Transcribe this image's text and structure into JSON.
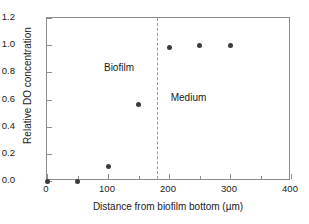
{
  "chart_data": {
    "type": "scatter",
    "title": "",
    "xlabel": "Distance from biofilm bottom (µm)",
    "ylabel": "Relative DO concentration",
    "xlim": [
      0,
      400
    ],
    "ylim": [
      0.0,
      1.2
    ],
    "grid": false,
    "legend": null,
    "xticks": [
      "0",
      "100",
      "200",
      "300",
      "400"
    ],
    "xtick_values": [
      0,
      100,
      200,
      300,
      400
    ],
    "xminor_values": [
      50,
      150,
      250,
      350
    ],
    "yticks": [
      "0.0",
      "0.2",
      "0.4",
      "0.6",
      "0.8",
      "1.0",
      "1.2"
    ],
    "ytick_values": [
      0.0,
      0.2,
      0.4,
      0.6,
      0.8,
      1.0,
      1.2
    ],
    "series": [
      {
        "name": "Relative DO concentration",
        "marker": "filled-circle",
        "color": "#3b3b3b",
        "x": [
          0,
          50,
          100,
          150,
          200,
          250,
          300
        ],
        "y": [
          0.0,
          0.0,
          0.11,
          0.56,
          0.98,
          1.0,
          1.0
        ]
      }
    ],
    "annotations": [
      {
        "text": "Biofilm",
        "x": 118,
        "y": 0.84,
        "name": "biofilm-region-label"
      },
      {
        "text": "Medium",
        "x": 232,
        "y": 0.62,
        "name": "medium-region-label"
      }
    ],
    "reference_lines": [
      {
        "orientation": "vertical",
        "x": 180,
        "style": "dashed",
        "color": "#9a9a9a",
        "name": "biofilm-medium-boundary"
      }
    ]
  }
}
